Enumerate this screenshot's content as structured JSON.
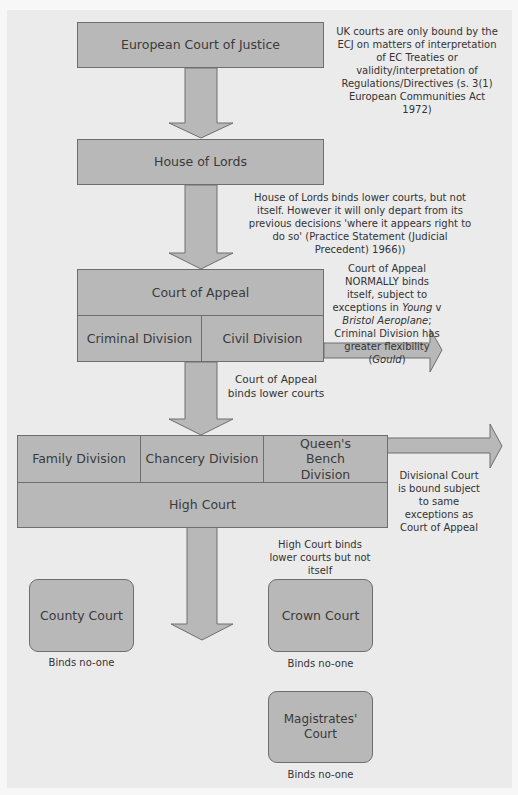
{
  "courts": {
    "ecj": "European Court of Justice",
    "house_of_lords": "House of Lords",
    "court_of_appeal": {
      "name": "Court of Appeal",
      "divisions": [
        "Criminal Division",
        "Civil Division"
      ]
    },
    "high_court": {
      "name": "High Court",
      "divisions": [
        "Family Division",
        "Chancery Division",
        "Queen's Bench Division"
      ]
    },
    "county_court": "County Court",
    "crown_court": "Crown Court",
    "magistrates_court": "Magistrates' Court"
  },
  "notes": {
    "ecj": "UK courts are only bound by the ECJ on matters of interpretation of EC Treaties or validity/interpretation of Regulations/Directives (s. 3(1) European Communities Act 1972)",
    "house_of_lords": "House of Lords binds lower courts, but not itself. However it will only depart from its previous decisions 'where it appears right to do so' (Practice Statement (Judicial Precedent) 1966))",
    "court_of_appeal_self": {
      "part1": "Court of Appeal NORMALLY binds itself, subject to exceptions in ",
      "case1a": "Young",
      "v": " v ",
      "case1b": "Bristol Aeroplane",
      "part2": "; Criminal Division has greater flexibility (",
      "case2": "Gould",
      "part3": ")"
    },
    "court_of_appeal_lower": "Court of Appeal binds lower courts",
    "divisional_court": "Divisional Court is bound subject to same exceptions as Court of Appeal",
    "high_court": "High Court binds lower courts but not itself",
    "county_court": "Binds no-one",
    "crown_court": "Binds no-one",
    "magistrates_court": "Binds no-one"
  },
  "colors": {
    "panel": "#ebebeb",
    "box_fill": "#b8b8b8",
    "box_border": "#6e6e6e"
  }
}
